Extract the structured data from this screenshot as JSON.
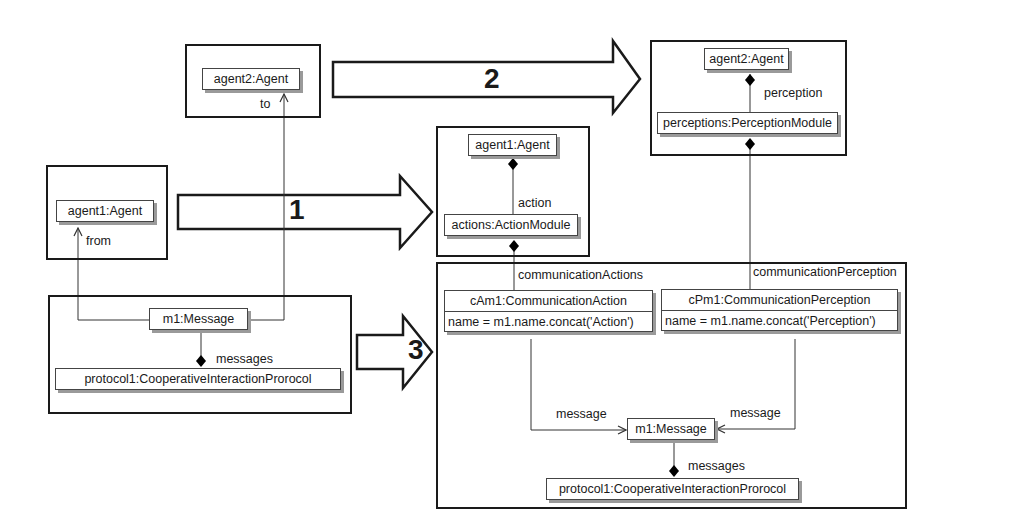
{
  "colors": {
    "stroke": "#1a1a1a",
    "shadow": "#9a9a9a",
    "background": "#ffffff"
  },
  "steps": [
    {
      "number": "1"
    },
    {
      "number": "2"
    },
    {
      "number": "3"
    }
  ],
  "left": {
    "agent2_box": {
      "object": "agent2:Agent",
      "role": "to"
    },
    "agent1_box": {
      "object": "agent1:Agent",
      "role": "from"
    },
    "message_box": {
      "message": "m1:Message",
      "protocol": "protocol1:CooperativeInteractionProrocol",
      "composition_role": "messages"
    }
  },
  "right": {
    "action_box": {
      "agent": "agent1:Agent",
      "role": "action",
      "module": "actions:ActionModule"
    },
    "perception_box": {
      "agent": "agent2:Agent",
      "role": "perception",
      "module": "perceptions:PerceptionModule"
    },
    "communication_box": {
      "actions_role": "communicationActions",
      "perception_role": "communicationPerception",
      "comm_action": {
        "title": "cAm1:CommunicationAction",
        "attr": "name = m1.name.concat('Action')"
      },
      "comm_perception": {
        "title": "cPm1:CommunicationPerception",
        "attr": "name = m1.name.concat('Perception')"
      },
      "message_role_left": "message",
      "message_role_right": "message",
      "message": "m1:Message",
      "composition_role": "messages",
      "protocol": "protocol1:CooperativeInteractionProrocol"
    }
  }
}
